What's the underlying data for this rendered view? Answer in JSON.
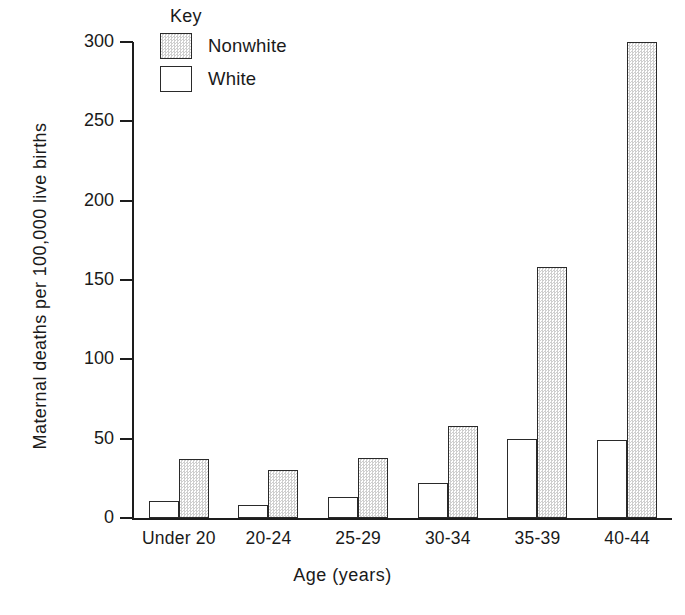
{
  "chart_data": {
    "type": "bar",
    "title": "",
    "xlabel": "Age (years)",
    "ylabel": "Maternal deaths per 100,000 live births",
    "categories": [
      "Under 20",
      "20-24",
      "25-29",
      "30-34",
      "35-39",
      "40-44"
    ],
    "series": [
      {
        "name": "White",
        "values": [
          11,
          8,
          13,
          22,
          50,
          49
        ]
      },
      {
        "name": "Nonwhite",
        "values": [
          37,
          30,
          38,
          58,
          158,
          300
        ]
      }
    ],
    "ylim": [
      0,
      300
    ],
    "yticks": [
      0,
      50,
      100,
      150,
      200,
      250,
      300
    ],
    "ytick_labels": [
      "0",
      "50",
      "100",
      "150",
      "200",
      "250",
      "300"
    ],
    "grid": false,
    "legend_position": "top-left-inside",
    "legend_title": "Key",
    "legend_entries": [
      {
        "label": "Nonwhite",
        "swatch": "shaded"
      },
      {
        "label": "White",
        "swatch": "empty"
      }
    ],
    "colors": {
      "axis": "#1d1d1d",
      "bar_outline": "#2a2a2a",
      "white_fill": "#ffffff",
      "nonwhite_fill": "#cfcfcf",
      "background": "#ffffff"
    }
  }
}
